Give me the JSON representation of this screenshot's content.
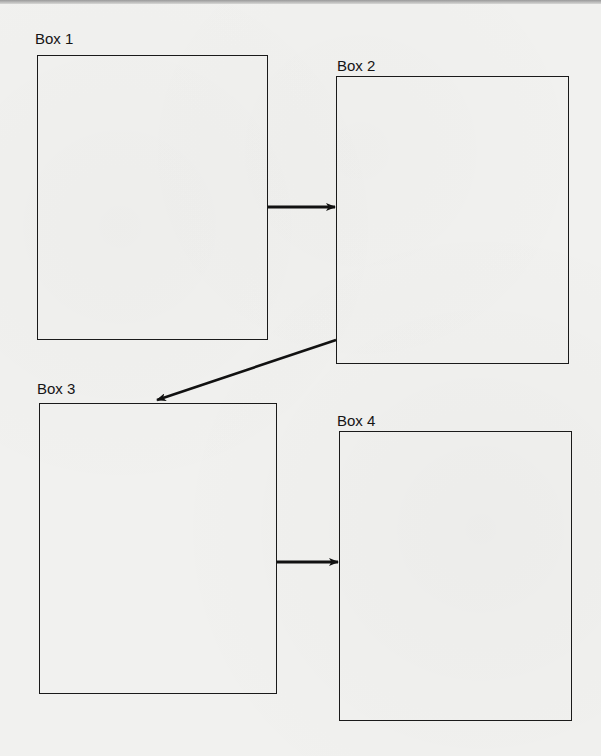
{
  "diagram": {
    "type": "flow",
    "boxes": [
      {
        "id": "box1",
        "label": "Box 1",
        "content": ""
      },
      {
        "id": "box2",
        "label": "Box 2",
        "content": ""
      },
      {
        "id": "box3",
        "label": "Box 3",
        "content": ""
      },
      {
        "id": "box4",
        "label": "Box 4",
        "content": ""
      }
    ],
    "arrows": [
      {
        "from": "box1",
        "to": "box2"
      },
      {
        "from": "box2",
        "to": "box3"
      },
      {
        "from": "box3",
        "to": "box4"
      }
    ]
  },
  "colors": {
    "background": "#f1f1ef",
    "line": "#1a1a1a"
  }
}
